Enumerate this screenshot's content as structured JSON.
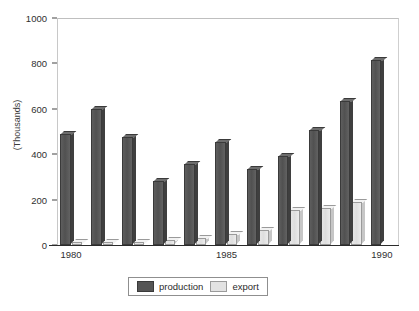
{
  "chart_data": {
    "type": "bar",
    "title": "",
    "subtitle": "",
    "xlabel": "",
    "ylabel": "(Thousands)",
    "ylim": [
      0,
      1000
    ],
    "ytick_labels": [
      "0",
      "200",
      "400",
      "600",
      "800",
      "1000"
    ],
    "ytick_values": [
      0,
      200,
      400,
      600,
      800,
      1000
    ],
    "grid": false,
    "legend_position": "bottom",
    "categories": [
      "1980",
      "1981",
      "1982",
      "1983",
      "1984",
      "1985",
      "1986",
      "1987",
      "1988",
      "1989",
      "1990"
    ],
    "xtick_labels_shown": [
      "1980",
      "1985",
      "1990"
    ],
    "series": [
      {
        "name": "production",
        "color": "#555555",
        "values": [
          490,
          600,
          475,
          280,
          355,
          455,
          335,
          390,
          505,
          635,
          815
        ]
      },
      {
        "name": "export",
        "color": "#e2e2e2",
        "values": [
          15,
          12,
          15,
          20,
          30,
          50,
          65,
          155,
          165,
          190,
          275
        ]
      }
    ]
  },
  "legend": {
    "items": [
      {
        "label": "production",
        "swatch": "production-swatch"
      },
      {
        "label": "export",
        "swatch": "export-swatch"
      }
    ]
  },
  "axis": {
    "y_title": "(Thousands)"
  }
}
